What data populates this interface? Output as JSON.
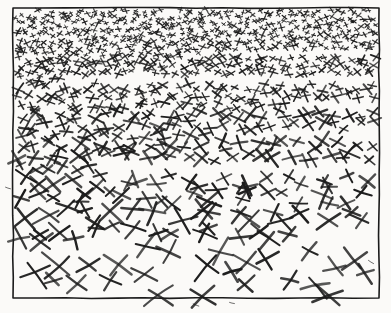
{
  "artwork": {
    "title": "Cross-hatch density gradient texture study",
    "medium": "pen and ink drawing",
    "canvas": {
      "width": 391,
      "height": 313
    },
    "background_color": "#fbfaf8",
    "ink_color": "#1b1b1b",
    "paper_tone": "#f7f6f3"
  },
  "frame": {
    "name": "hand-drawn-rectangle-border",
    "x": 13,
    "y": 8,
    "width": 366,
    "height": 290,
    "stroke_color": "#1b1b1b",
    "stroke_width": 1.6
  },
  "chart_data": {
    "type": "scatter",
    "xlabel": "",
    "ylabel": "",
    "xlim": [
      13,
      379
    ],
    "ylim": [
      8,
      298
    ],
    "grid": false,
    "legend": null,
    "gradient": {
      "direction": "top-to-bottom",
      "top_mark_size_px": 4.5,
      "bottom_mark_size_px": 29,
      "top_marks_per_1000px2": 30,
      "bottom_marks_per_1000px2": 1.6,
      "total_marks": 1020
    },
    "bands": [
      {
        "label": "band-1",
        "y_range": [
          8,
          32
        ],
        "mark_size_px": 5,
        "marks": 236,
        "density": "very-dense"
      },
      {
        "label": "band-2",
        "y_range": [
          32,
          56
        ],
        "mark_size_px": 6,
        "marks": 186,
        "density": "very-dense"
      },
      {
        "label": "band-3",
        "y_range": [
          56,
          82
        ],
        "mark_size_px": 8,
        "marks": 138,
        "density": "dense"
      },
      {
        "label": "band-4",
        "y_range": [
          82,
          110
        ],
        "mark_size_px": 10,
        "marks": 102,
        "density": "dense"
      },
      {
        "label": "band-5",
        "y_range": [
          110,
          140
        ],
        "mark_size_px": 13,
        "marks": 76,
        "density": "medium"
      },
      {
        "label": "band-6",
        "y_range": [
          140,
          172
        ],
        "mark_size_px": 16,
        "marks": 58,
        "density": "medium"
      },
      {
        "label": "band-7",
        "y_range": [
          172,
          206
        ],
        "mark_size_px": 19,
        "marks": 44,
        "density": "sparse"
      },
      {
        "label": "band-8",
        "y_range": [
          206,
          242
        ],
        "mark_size_px": 23,
        "marks": 34,
        "density": "sparse"
      },
      {
        "label": "band-9",
        "y_range": [
          242,
          298
        ],
        "mark_size_px": 28,
        "marks": 26,
        "density": "very-sparse"
      }
    ],
    "x": [],
    "y": []
  }
}
